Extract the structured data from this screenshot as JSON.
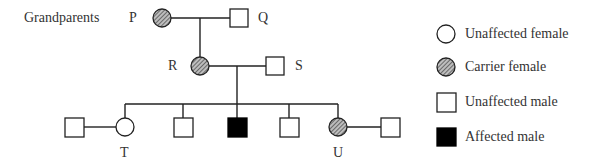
{
  "diagram": {
    "type": "pedigree",
    "generation_label": "Grandparents",
    "individuals": {
      "P": {
        "label": "P",
        "sex": "female",
        "status": "carrier"
      },
      "Q": {
        "label": "Q",
        "sex": "male",
        "status": "unaffected"
      },
      "R": {
        "label": "R",
        "sex": "female",
        "status": "carrier"
      },
      "S": {
        "label": "S",
        "sex": "male",
        "status": "unaffected"
      },
      "T": {
        "label": "T",
        "sex": "female",
        "status": "unaffected"
      },
      "U": {
        "label": "U",
        "sex": "female",
        "status": "carrier"
      }
    },
    "generation3": [
      {
        "id": "T_spouse",
        "label": "",
        "sex": "male",
        "status": "unaffected"
      },
      {
        "id": "T",
        "label": "T",
        "sex": "female",
        "status": "unaffected"
      },
      {
        "id": "son1",
        "label": "",
        "sex": "male",
        "status": "unaffected"
      },
      {
        "id": "son2",
        "label": "",
        "sex": "male",
        "status": "affected"
      },
      {
        "id": "son3",
        "label": "",
        "sex": "male",
        "status": "unaffected"
      },
      {
        "id": "U",
        "label": "U",
        "sex": "female",
        "status": "carrier"
      },
      {
        "id": "U_spouse",
        "label": "",
        "sex": "male",
        "status": "unaffected"
      }
    ]
  },
  "legend": [
    {
      "symbol": "circle-open",
      "label": "Unaffected female"
    },
    {
      "symbol": "circle-hatched",
      "label": "Carrier female"
    },
    {
      "symbol": "square-open",
      "label": "Unaffected male"
    },
    {
      "symbol": "square-filled",
      "label": "Affected male"
    }
  ],
  "colors": {
    "line": "#222222",
    "hatch": "#555555",
    "affected": "#000000"
  }
}
